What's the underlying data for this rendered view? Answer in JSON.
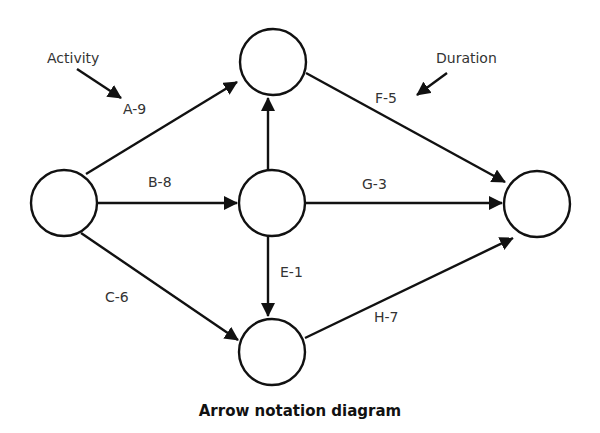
{
  "diagram": {
    "title": "Arrow notation diagram",
    "annotations": {
      "activity": "Activity",
      "duration": "Duration"
    },
    "nodes": [
      {
        "id": "start",
        "cx": 64,
        "cy": 203
      },
      {
        "id": "top",
        "cx": 273,
        "cy": 62
      },
      {
        "id": "middle",
        "cx": 272,
        "cy": 203
      },
      {
        "id": "bottom",
        "cx": 272,
        "cy": 352
      },
      {
        "id": "end",
        "cx": 537,
        "cy": 204
      }
    ],
    "activities": [
      {
        "label": "A-9",
        "activity": "A",
        "duration": 9,
        "from": "start",
        "to": "top"
      },
      {
        "label": "B-8",
        "activity": "B",
        "duration": 8,
        "from": "start",
        "to": "middle"
      },
      {
        "label": "C-6",
        "activity": "C",
        "duration": 6,
        "from": "start",
        "to": "bottom"
      },
      {
        "label": "D",
        "activity": "D",
        "from": "middle",
        "to": "top"
      },
      {
        "label": "E-1",
        "activity": "E",
        "duration": 1,
        "from": "middle",
        "to": "bottom"
      },
      {
        "label": "F-5",
        "activity": "F",
        "duration": 5,
        "from": "top",
        "to": "end"
      },
      {
        "label": "G-3",
        "activity": "G",
        "duration": 3,
        "from": "middle",
        "to": "end"
      },
      {
        "label": "H-7",
        "activity": "H",
        "duration": 7,
        "from": "bottom",
        "to": "end"
      }
    ],
    "edge_labels": {
      "A": "A-9",
      "B": "B-8",
      "C": "C-6",
      "E": "E-1",
      "F": "F-5",
      "G": "G-3",
      "H": "H-7"
    },
    "colors": {
      "stroke": "#111111",
      "label": "#333333",
      "background": "#ffffff"
    }
  }
}
